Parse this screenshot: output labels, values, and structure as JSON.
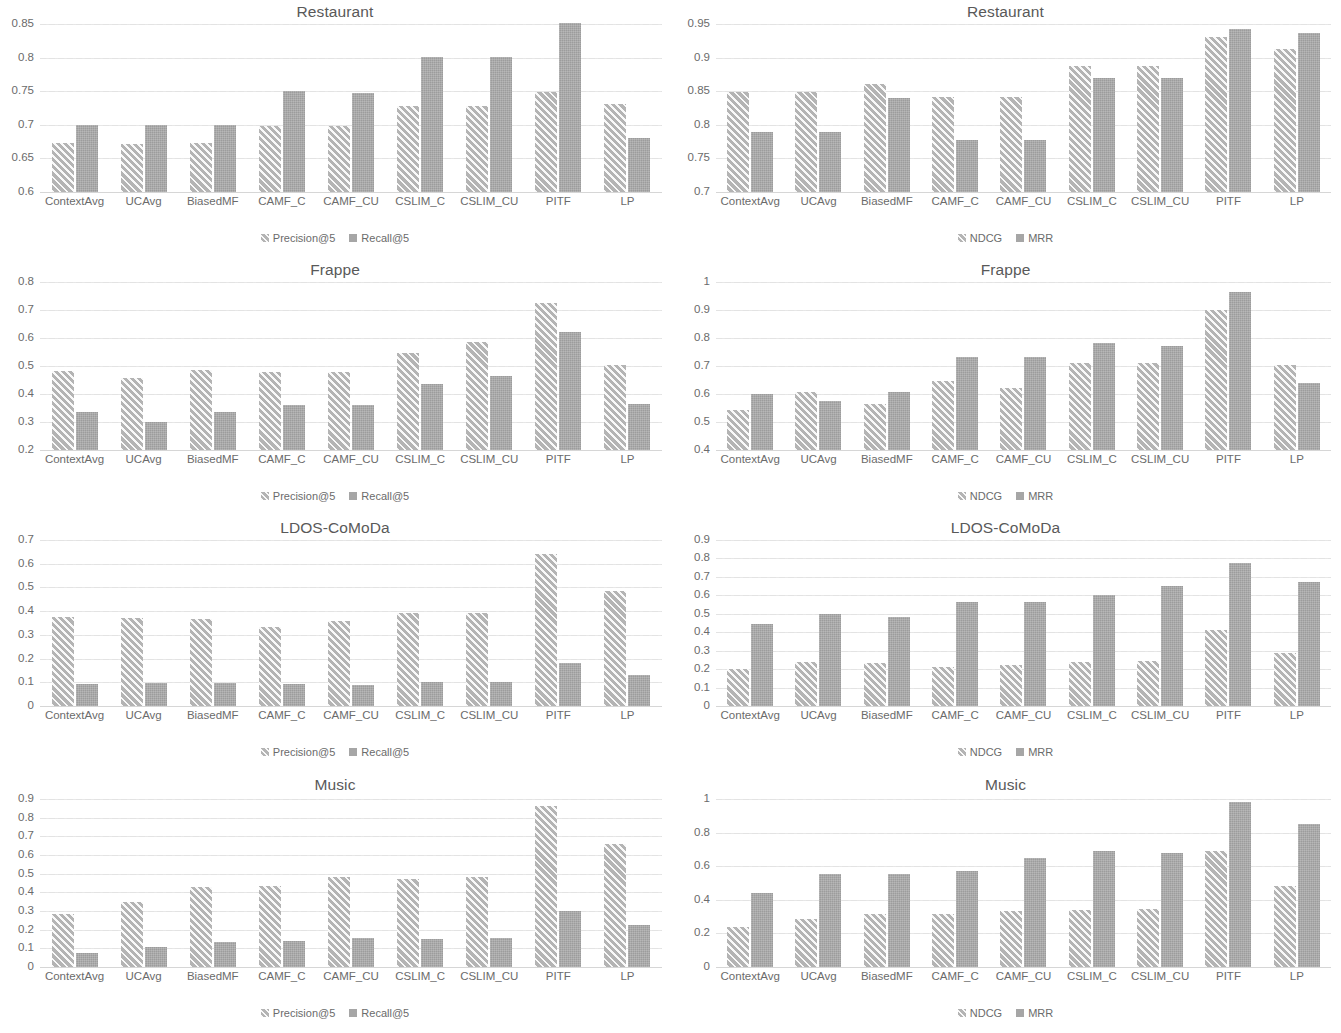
{
  "figure": {
    "categories": [
      "ContextAvg",
      "UCAvg",
      "BiasedMF",
      "CAMF_C",
      "CAMF_CU",
      "CSLIM_C",
      "CSLIM_CU",
      "PITF",
      "LP"
    ],
    "colors": {
      "series1": "#b4b4b4",
      "series2": "#a6a6a6",
      "gridline": "#e3e3e3",
      "text": "#6b6b6b"
    }
  },
  "chart_data": [
    {
      "id": "restaurant-precision-recall",
      "type": "bar",
      "title": "Restaurant",
      "xlabel": "",
      "ylabel": "",
      "ylim": [
        0.6,
        0.85
      ],
      "yticks": [
        "0.85",
        "0.8",
        "0.75",
        "0.7",
        "0.65",
        "0.6"
      ],
      "ytick_values": [
        0.85,
        0.8,
        0.75,
        0.7,
        0.65,
        0.6
      ],
      "grid": true,
      "legend_position": "bottom",
      "categories": [
        "ContextAvg",
        "UCAvg",
        "BiasedMF",
        "CAMF_C",
        "CAMF_CU",
        "CSLIM_C",
        "CSLIM_CU",
        "PITF",
        "LP"
      ],
      "series": [
        {
          "name": "Precision@5",
          "values": [
            0.673,
            0.672,
            0.673,
            0.698,
            0.698,
            0.728,
            0.728,
            0.749,
            0.731
          ]
        },
        {
          "name": "Recall@5",
          "values": [
            0.7,
            0.7,
            0.7,
            0.75,
            0.748,
            0.801,
            0.801,
            0.851,
            0.68
          ]
        }
      ]
    },
    {
      "id": "restaurant-ndcg-mrr",
      "type": "bar",
      "title": "Restaurant",
      "xlabel": "",
      "ylabel": "",
      "ylim": [
        0.7,
        0.95
      ],
      "yticks": [
        "0.95",
        "0.9",
        "0.85",
        "0.8",
        "0.75",
        "0.7"
      ],
      "ytick_values": [
        0.95,
        0.9,
        0.85,
        0.8,
        0.75,
        0.7
      ],
      "grid": true,
      "legend_position": "bottom",
      "categories": [
        "ContextAvg",
        "UCAvg",
        "BiasedMF",
        "CAMF_C",
        "CAMF_CU",
        "CSLIM_C",
        "CSLIM_CU",
        "PITF",
        "LP"
      ],
      "series": [
        {
          "name": "NDCG",
          "values": [
            0.849,
            0.849,
            0.861,
            0.841,
            0.841,
            0.888,
            0.888,
            0.931,
            0.913
          ]
        },
        {
          "name": "MRR",
          "values": [
            0.79,
            0.79,
            0.84,
            0.778,
            0.778,
            0.87,
            0.87,
            0.943,
            0.936
          ]
        }
      ]
    },
    {
      "id": "frappe-precision-recall",
      "type": "bar",
      "title": "Frappe",
      "xlabel": "",
      "ylabel": "",
      "ylim": [
        0.2,
        0.8
      ],
      "yticks": [
        "0.8",
        "0.7",
        "0.6",
        "0.5",
        "0.4",
        "0.3",
        "0.2"
      ],
      "ytick_values": [
        0.8,
        0.7,
        0.6,
        0.5,
        0.4,
        0.3,
        0.2
      ],
      "grid": true,
      "legend_position": "bottom",
      "categories": [
        "ContextAvg",
        "UCAvg",
        "BiasedMF",
        "CAMF_C",
        "CAMF_CU",
        "CSLIM_C",
        "CSLIM_CU",
        "PITF",
        "LP"
      ],
      "series": [
        {
          "name": "Precision@5",
          "values": [
            0.481,
            0.456,
            0.484,
            0.479,
            0.48,
            0.546,
            0.585,
            0.725,
            0.505
          ]
        },
        {
          "name": "Recall@5",
          "values": [
            0.335,
            0.3,
            0.335,
            0.362,
            0.362,
            0.434,
            0.465,
            0.623,
            0.366
          ]
        }
      ]
    },
    {
      "id": "frappe-ndcg-mrr",
      "type": "bar",
      "title": "Frappe",
      "xlabel": "",
      "ylabel": "",
      "ylim": [
        0.4,
        1.0
      ],
      "yticks": [
        "1",
        "0.9",
        "0.8",
        "0.7",
        "0.6",
        "0.5",
        "0.4"
      ],
      "ytick_values": [
        1.0,
        0.9,
        0.8,
        0.7,
        0.6,
        0.5,
        0.4
      ],
      "grid": true,
      "legend_position": "bottom",
      "categories": [
        "ContextAvg",
        "UCAvg",
        "BiasedMF",
        "CAMF_C",
        "CAMF_CU",
        "CSLIM_C",
        "CSLIM_CU",
        "PITF",
        "LP"
      ],
      "series": [
        {
          "name": "NDCG",
          "values": [
            0.543,
            0.608,
            0.563,
            0.645,
            0.622,
            0.712,
            0.712,
            0.901,
            0.704
          ]
        },
        {
          "name": "MRR",
          "values": [
            0.601,
            0.575,
            0.608,
            0.733,
            0.731,
            0.782,
            0.773,
            0.963,
            0.641
          ]
        }
      ]
    },
    {
      "id": "ldos-comoda-precision-recall",
      "type": "bar",
      "title": "LDOS-CoMoDa",
      "xlabel": "",
      "ylabel": "",
      "ylim": [
        0,
        0.7
      ],
      "yticks": [
        "0.7",
        "0.6",
        "0.5",
        "0.4",
        "0.3",
        "0.2",
        "0.1",
        "0"
      ],
      "ytick_values": [
        0.7,
        0.6,
        0.5,
        0.4,
        0.3,
        0.2,
        0.1,
        0
      ],
      "grid": true,
      "legend_position": "bottom",
      "categories": [
        "ContextAvg",
        "UCAvg",
        "BiasedMF",
        "CAMF_C",
        "CAMF_CU",
        "CSLIM_C",
        "CSLIM_CU",
        "PITF",
        "LP"
      ],
      "series": [
        {
          "name": "Precision@5",
          "values": [
            0.374,
            0.371,
            0.367,
            0.333,
            0.357,
            0.393,
            0.393,
            0.641,
            0.483
          ]
        },
        {
          "name": "Recall@5",
          "values": [
            0.091,
            0.097,
            0.099,
            0.093,
            0.088,
            0.101,
            0.101,
            0.18,
            0.129
          ]
        }
      ]
    },
    {
      "id": "ldos-comoda-ndcg-mrr",
      "type": "bar",
      "title": "LDOS-CoMoDa",
      "xlabel": "",
      "ylabel": "",
      "ylim": [
        0,
        0.9
      ],
      "yticks": [
        "0.9",
        "0.8",
        "0.7",
        "0.6",
        "0.5",
        "0.4",
        "0.3",
        "0.2",
        "0.1",
        "0"
      ],
      "ytick_values": [
        0.9,
        0.8,
        0.7,
        0.6,
        0.5,
        0.4,
        0.3,
        0.2,
        0.1,
        0
      ],
      "grid": true,
      "legend_position": "bottom",
      "categories": [
        "ContextAvg",
        "UCAvg",
        "BiasedMF",
        "CAMF_C",
        "CAMF_CU",
        "CSLIM_C",
        "CSLIM_CU",
        "PITF",
        "LP"
      ],
      "series": [
        {
          "name": "NDCG",
          "values": [
            0.203,
            0.24,
            0.234,
            0.209,
            0.223,
            0.24,
            0.243,
            0.414,
            0.287
          ]
        },
        {
          "name": "MRR",
          "values": [
            0.447,
            0.501,
            0.484,
            0.566,
            0.565,
            0.604,
            0.652,
            0.777,
            0.671
          ]
        }
      ]
    },
    {
      "id": "music-precision-recall",
      "type": "bar",
      "title": "Music",
      "xlabel": "",
      "ylabel": "",
      "ylim": [
        0,
        0.9
      ],
      "yticks": [
        "0.9",
        "0.8",
        "0.7",
        "0.6",
        "0.5",
        "0.4",
        "0.3",
        "0.2",
        "0.1",
        "0"
      ],
      "ytick_values": [
        0.9,
        0.8,
        0.7,
        0.6,
        0.5,
        0.4,
        0.3,
        0.2,
        0.1,
        0
      ],
      "grid": true,
      "legend_position": "bottom",
      "categories": [
        "ContextAvg",
        "UCAvg",
        "BiasedMF",
        "CAMF_C",
        "CAMF_CU",
        "CSLIM_C",
        "CSLIM_CU",
        "PITF",
        "LP"
      ],
      "series": [
        {
          "name": "Precision@5",
          "values": [
            0.283,
            0.347,
            0.43,
            0.434,
            0.48,
            0.472,
            0.484,
            0.864,
            0.66
          ]
        },
        {
          "name": "Recall@5",
          "values": [
            0.076,
            0.106,
            0.133,
            0.138,
            0.158,
            0.152,
            0.155,
            0.301,
            0.226
          ]
        }
      ]
    },
    {
      "id": "music-ndcg-mrr",
      "type": "bar",
      "title": "Music",
      "xlabel": "",
      "ylabel": "",
      "ylim": [
        0,
        1.0
      ],
      "yticks": [
        "1",
        "0.8",
        "0.6",
        "0.4",
        "0.2",
        "0"
      ],
      "ytick_values": [
        1.0,
        0.8,
        0.6,
        0.4,
        0.2,
        0
      ],
      "grid": true,
      "legend_position": "bottom",
      "categories": [
        "ContextAvg",
        "UCAvg",
        "BiasedMF",
        "CAMF_C",
        "CAMF_CU",
        "CSLIM_C",
        "CSLIM_CU",
        "PITF",
        "LP"
      ],
      "series": [
        {
          "name": "NDCG",
          "values": [
            0.237,
            0.283,
            0.313,
            0.313,
            0.334,
            0.342,
            0.347,
            0.69,
            0.482
          ]
        },
        {
          "name": "MRR",
          "values": [
            0.44,
            0.551,
            0.553,
            0.57,
            0.646,
            0.692,
            0.681,
            0.984,
            0.85
          ]
        }
      ]
    }
  ]
}
